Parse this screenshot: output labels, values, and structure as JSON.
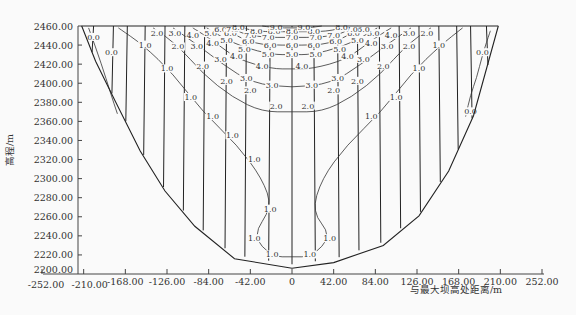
{
  "chart_data": {
    "type": "contour",
    "title": "",
    "xlabel": "与最大坝高处距离/m",
    "ylabel": "高程/m",
    "xlim": [
      -252,
      252
    ],
    "ylim": [
      2200,
      2460
    ],
    "x_ticks": [
      "-252.00",
      "-210.00",
      "-168.00",
      "-126.00",
      "-84.00",
      "-42.00",
      "0",
      "42.00",
      "84.00",
      "126.00",
      "168.00",
      "210.00",
      "252.00"
    ],
    "x_tick_values": [
      -252,
      -210,
      -168,
      -126,
      -84,
      -42,
      0,
      42,
      84,
      126,
      168,
      210,
      252
    ],
    "y_ticks": [
      "2200.00",
      "2220.00",
      "2240.00",
      "2260.00",
      "2280.00",
      "2300.00",
      "2320.00",
      "2340.00",
      "2360.00",
      "2380.00",
      "2400.00",
      "2420.00",
      "2440.00",
      "2460.00"
    ],
    "y_tick_values": [
      2200,
      2220,
      2240,
      2260,
      2280,
      2300,
      2320,
      2340,
      2360,
      2380,
      2400,
      2420,
      2440,
      2460
    ],
    "contour_levels": [
      0.0,
      1.0,
      2.0,
      3.0,
      4.0,
      5.0,
      6.0,
      7.0,
      8.0,
      9.0
    ],
    "grid": false,
    "legend": "none",
    "dam_outline": [
      [
        -212,
        2460
      ],
      [
        -198,
        2423
      ],
      [
        -178,
        2381
      ],
      [
        -153,
        2329
      ],
      [
        -128,
        2287
      ],
      [
        -98,
        2250
      ],
      [
        -58,
        2216
      ],
      [
        0,
        2206
      ],
      [
        42,
        2212
      ],
      [
        92,
        2230
      ],
      [
        128,
        2261
      ],
      [
        158,
        2308
      ],
      [
        183,
        2366
      ],
      [
        208,
        2460
      ]
    ],
    "vertical_lines_x": [
      -200,
      -180,
      -166,
      -148,
      -128,
      -108,
      -88,
      -66,
      -46,
      -22,
      0,
      22,
      46,
      66,
      88,
      108,
      128,
      148,
      166,
      180,
      196
    ],
    "contours": [
      {
        "level": "0.0",
        "points": [
          [
            -205,
            2458
          ],
          [
            -192,
            2420
          ],
          [
            -183,
            2390
          ],
          [
            -176,
            2368
          ]
        ],
        "labels": [
          [
            -200,
            2448
          ],
          [
            -182,
            2432
          ]
        ]
      },
      {
        "level": "0.0",
        "points": [
          [
            200,
            2455
          ],
          [
            192,
            2430
          ],
          [
            186,
            2405
          ],
          [
            180,
            2388
          ],
          [
            175,
            2365
          ]
        ],
        "labels": [
          [
            192,
            2432
          ],
          [
            180,
            2370
          ]
        ]
      },
      {
        "level": "1.0",
        "points": [
          [
            -175,
            2458
          ],
          [
            -150,
            2440
          ],
          [
            -120,
            2410
          ],
          [
            -90,
            2370
          ],
          [
            -55,
            2335
          ],
          [
            -30,
            2300
          ],
          [
            -20,
            2270
          ],
          [
            -40,
            2240
          ],
          [
            -20,
            2218
          ],
          [
            0,
            2218
          ],
          [
            20,
            2218
          ],
          [
            40,
            2240
          ],
          [
            20,
            2265
          ],
          [
            30,
            2300
          ],
          [
            55,
            2335
          ],
          [
            90,
            2370
          ],
          [
            120,
            2410
          ],
          [
            150,
            2440
          ],
          [
            172,
            2458
          ]
        ],
        "labels": [
          [
            -148,
            2440
          ],
          [
            -126,
            2415
          ],
          [
            -102,
            2385
          ],
          [
            -80,
            2365
          ],
          [
            -60,
            2345
          ],
          [
            -38,
            2320
          ],
          [
            -22,
            2268
          ],
          [
            -38,
            2237
          ],
          [
            -20,
            2220
          ],
          [
            18,
            2220
          ],
          [
            38,
            2237
          ],
          [
            80,
            2365
          ],
          [
            105,
            2385
          ],
          [
            128,
            2415
          ],
          [
            148,
            2440
          ]
        ]
      },
      {
        "level": "2.0",
        "points": [
          [
            -140,
            2458
          ],
          [
            -115,
            2440
          ],
          [
            -90,
            2410
          ],
          [
            -60,
            2385
          ],
          [
            -30,
            2370
          ],
          [
            0,
            2370
          ],
          [
            30,
            2370
          ],
          [
            60,
            2385
          ],
          [
            90,
            2410
          ],
          [
            115,
            2440
          ],
          [
            140,
            2458
          ]
        ],
        "labels": [
          [
            -136,
            2452
          ],
          [
            -115,
            2438
          ],
          [
            -90,
            2418
          ],
          [
            -66,
            2402
          ],
          [
            -42,
            2392
          ],
          [
            -16,
            2376
          ],
          [
            16,
            2376
          ],
          [
            42,
            2392
          ],
          [
            66,
            2402
          ],
          [
            92,
            2418
          ],
          [
            118,
            2438
          ],
          [
            136,
            2452
          ]
        ]
      },
      {
        "level": "3.0",
        "points": [
          [
            -120,
            2458
          ],
          [
            -95,
            2440
          ],
          [
            -70,
            2420
          ],
          [
            -40,
            2400
          ],
          [
            0,
            2395
          ],
          [
            40,
            2400
          ],
          [
            70,
            2420
          ],
          [
            95,
            2440
          ],
          [
            120,
            2458
          ]
        ],
        "labels": [
          [
            -118,
            2452
          ],
          [
            -96,
            2438
          ],
          [
            -72,
            2425
          ],
          [
            -46,
            2405
          ],
          [
            -20,
            2398
          ],
          [
            20,
            2398
          ],
          [
            46,
            2405
          ],
          [
            72,
            2425
          ],
          [
            96,
            2438
          ],
          [
            118,
            2452
          ]
        ]
      },
      {
        "level": "4.0",
        "points": [
          [
            -100,
            2458
          ],
          [
            -80,
            2445
          ],
          [
            -55,
            2425
          ],
          [
            -20,
            2415
          ],
          [
            0,
            2415
          ],
          [
            20,
            2415
          ],
          [
            55,
            2425
          ],
          [
            80,
            2445
          ],
          [
            100,
            2458
          ]
        ],
        "labels": [
          [
            -100,
            2450
          ],
          [
            -80,
            2442
          ],
          [
            -56,
            2428
          ],
          [
            -30,
            2418
          ],
          [
            10,
            2418
          ],
          [
            56,
            2428
          ],
          [
            80,
            2442
          ],
          [
            100,
            2450
          ]
        ]
      },
      {
        "level": "5.0",
        "points": [
          [
            -86,
            2458
          ],
          [
            -70,
            2448
          ],
          [
            -50,
            2438
          ],
          [
            -20,
            2430
          ],
          [
            0,
            2430
          ],
          [
            20,
            2430
          ],
          [
            50,
            2438
          ],
          [
            70,
            2448
          ],
          [
            86,
            2458
          ]
        ],
        "labels": [
          [
            -82,
            2452
          ],
          [
            -66,
            2445
          ],
          [
            -48,
            2435
          ],
          [
            -24,
            2430
          ],
          [
            0,
            2430
          ],
          [
            24,
            2430
          ],
          [
            48,
            2435
          ],
          [
            66,
            2445
          ],
          [
            82,
            2452
          ]
        ]
      },
      {
        "level": "6.0",
        "points": [
          [
            -74,
            2460
          ],
          [
            -60,
            2452
          ],
          [
            -40,
            2442
          ],
          [
            -20,
            2440
          ],
          [
            0,
            2440
          ],
          [
            20,
            2440
          ],
          [
            40,
            2442
          ],
          [
            60,
            2452
          ],
          [
            74,
            2460
          ]
        ],
        "labels": [
          [
            -72,
            2456
          ],
          [
            -62,
            2452
          ],
          [
            -44,
            2444
          ],
          [
            -22,
            2440
          ],
          [
            0,
            2440
          ],
          [
            22,
            2440
          ],
          [
            44,
            2444
          ],
          [
            62,
            2452
          ],
          [
            72,
            2456
          ]
        ]
      },
      {
        "level": "7.0",
        "points": [
          [
            -66,
            2460
          ],
          [
            -50,
            2452
          ],
          [
            -30,
            2448
          ],
          [
            0,
            2448
          ],
          [
            30,
            2448
          ],
          [
            50,
            2452
          ],
          [
            66,
            2460
          ]
        ],
        "labels": [
          [
            -60,
            2456
          ],
          [
            -42,
            2450
          ],
          [
            -24,
            2448
          ],
          [
            0,
            2448
          ],
          [
            24,
            2448
          ],
          [
            42,
            2450
          ],
          [
            60,
            2456
          ]
        ]
      },
      {
        "level": "8.0",
        "points": [
          [
            -56,
            2460
          ],
          [
            -36,
            2454
          ],
          [
            0,
            2454
          ],
          [
            36,
            2454
          ],
          [
            56,
            2460
          ]
        ],
        "labels": [
          [
            -54,
            2458
          ],
          [
            -36,
            2454
          ],
          [
            -18,
            2454
          ],
          [
            0,
            2454
          ],
          [
            22,
            2454
          ],
          [
            50,
            2458
          ]
        ]
      },
      {
        "level": "9.0",
        "points": [
          [
            -30,
            2460
          ],
          [
            -15,
            2458
          ],
          [
            0,
            2458
          ],
          [
            15,
            2458
          ],
          [
            30,
            2460
          ]
        ],
        "labels": [
          [
            -16,
            2458
          ],
          [
            12,
            2458
          ]
        ]
      }
    ]
  }
}
